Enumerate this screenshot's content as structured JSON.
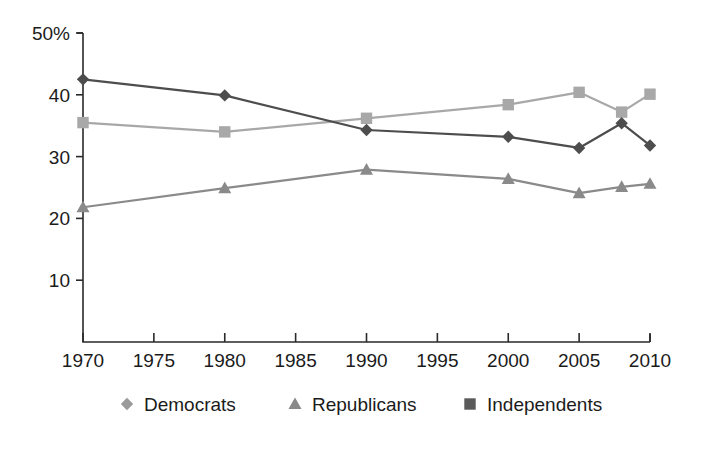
{
  "chart_data": {
    "type": "line",
    "title": "",
    "subtitle": "",
    "xlabel": "",
    "ylabel": "",
    "x": [
      1970,
      1980,
      1990,
      2000,
      2005,
      2008,
      2010
    ],
    "xlim": [
      1970,
      2010
    ],
    "ylim": [
      0,
      50
    ],
    "grid": false,
    "legend_position": "bottom",
    "x_tick_labels": [
      "1970",
      "1975",
      "1980",
      "1985",
      "1990",
      "1995",
      "2000",
      "2005",
      "2010"
    ],
    "x_tick_values": [
      1970,
      1975,
      1980,
      1985,
      1990,
      1995,
      2000,
      2005,
      2010
    ],
    "y_tick_labels": [
      "50%",
      "40",
      "30",
      "20",
      "10"
    ],
    "y_tick_values": [
      50,
      40,
      30,
      20,
      10
    ],
    "series": [
      {
        "name": "Democrats",
        "marker": "diamond",
        "color": "#4d4d4d",
        "values": [
          42.5,
          39.9,
          34.3,
          33.2,
          31.4,
          35.4,
          31.8
        ]
      },
      {
        "name": "Republicans",
        "marker": "triangle",
        "color": "#8a8a8a",
        "values": [
          21.8,
          24.9,
          27.9,
          26.4,
          24.1,
          25.1,
          25.6
        ]
      },
      {
        "name": "Independents",
        "marker": "square",
        "color": "#a8a8a8",
        "values": [
          35.5,
          34.0,
          36.2,
          38.4,
          40.4,
          37.2,
          40.1
        ]
      }
    ]
  },
  "legend": {
    "items": [
      {
        "label": "Democrats",
        "marker": "diamond",
        "color": "#9a9a9a"
      },
      {
        "label": "Republicans",
        "marker": "triangle",
        "color": "#8a8a8a"
      },
      {
        "label": "Independents",
        "marker": "square",
        "color": "#5a5a5a"
      }
    ]
  },
  "axis_colors": {
    "axis": "#2a2a2a",
    "text": "#1b1b1b"
  }
}
